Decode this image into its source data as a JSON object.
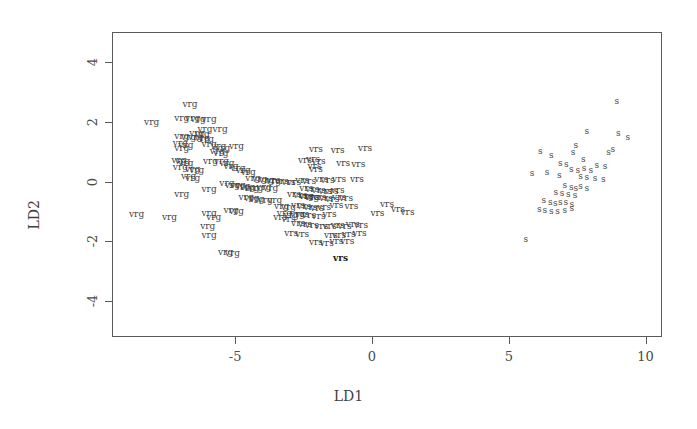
{
  "chart_data": {
    "type": "scatter",
    "title": "",
    "xlabel": "LD1",
    "ylabel": "LD2",
    "xlim": [
      -9.5,
      10.6
    ],
    "ylim": [
      -5.2,
      5.0
    ],
    "xticks": [
      -5,
      0,
      5,
      10
    ],
    "xticklabels": [
      "-5",
      "0",
      "5",
      "10"
    ],
    "yticks": [
      -4,
      -2,
      0,
      2,
      4
    ],
    "yticklabels": [
      "-4",
      "-2",
      "0",
      "2",
      "4"
    ],
    "grid": false,
    "legend": "none",
    "marker_style": "text-labels",
    "groups": [
      "vrg",
      "vrs",
      "s"
    ],
    "series": [
      {
        "name": "vrg",
        "label": "vrg",
        "points": [
          [
            -6.65,
            2.6
          ],
          [
            -6.95,
            2.12
          ],
          [
            -6.55,
            2.12
          ],
          [
            -6.35,
            2.08
          ],
          [
            -5.95,
            2.08
          ],
          [
            -8.05,
            1.98
          ],
          [
            -6.1,
            1.75
          ],
          [
            -5.55,
            1.75
          ],
          [
            -6.95,
            1.52
          ],
          [
            -6.7,
            1.5
          ],
          [
            -6.45,
            1.48
          ],
          [
            -6.2,
            1.45
          ],
          [
            -6.05,
            1.42
          ],
          [
            -7.0,
            1.3
          ],
          [
            -6.8,
            1.22
          ],
          [
            -6.95,
            1.12
          ],
          [
            -5.95,
            1.25
          ],
          [
            -5.6,
            1.2
          ],
          [
            -5.45,
            1.12
          ],
          [
            -4.95,
            1.2
          ],
          [
            -5.65,
            1.02
          ],
          [
            -5.52,
            0.95
          ],
          [
            -7.05,
            0.72
          ],
          [
            -6.92,
            0.68
          ],
          [
            -6.8,
            0.62
          ],
          [
            -5.9,
            0.7
          ],
          [
            -5.5,
            0.68
          ],
          [
            -5.3,
            0.62
          ],
          [
            -7.0,
            0.48
          ],
          [
            -6.55,
            0.42
          ],
          [
            -6.4,
            0.38
          ],
          [
            -4.9,
            0.45
          ],
          [
            -4.7,
            0.4
          ],
          [
            -4.52,
            0.32
          ],
          [
            -6.7,
            0.18
          ],
          [
            -6.55,
            0.12
          ],
          [
            -4.35,
            0.12
          ],
          [
            -4.1,
            0.08
          ],
          [
            -3.85,
            0.05
          ],
          [
            -3.6,
            0.02
          ],
          [
            -5.3,
            -0.05
          ],
          [
            -5.1,
            -0.1
          ],
          [
            -4.9,
            -0.12
          ],
          [
            -4.72,
            -0.15
          ],
          [
            -4.55,
            -0.18
          ],
          [
            -4.4,
            -0.2
          ],
          [
            -4.25,
            -0.22
          ],
          [
            -3.95,
            -0.18
          ],
          [
            -3.7,
            -0.2
          ],
          [
            -5.95,
            -0.25
          ],
          [
            -6.95,
            -0.42
          ],
          [
            -4.6,
            -0.52
          ],
          [
            -4.4,
            -0.55
          ],
          [
            -4.2,
            -0.58
          ],
          [
            -3.9,
            -0.6
          ],
          [
            -3.55,
            -0.62
          ],
          [
            -8.6,
            -1.1
          ],
          [
            -7.4,
            -1.2
          ],
          [
            -5.95,
            -1.05
          ],
          [
            -5.78,
            -1.18
          ],
          [
            -3.2,
            -1.05
          ],
          [
            -2.95,
            -1.12
          ],
          [
            -2.72,
            -1.08
          ],
          [
            -6.0,
            -1.5
          ],
          [
            -5.95,
            -1.78
          ],
          [
            -5.35,
            -2.35
          ],
          [
            -5.1,
            -2.38
          ],
          [
            -3.3,
            -0.82
          ],
          [
            -3.05,
            -0.85
          ],
          [
            -2.4,
            -0.48
          ],
          [
            -2.2,
            -0.52
          ],
          [
            -5.15,
            -0.95
          ],
          [
            -4.95,
            -0.98
          ],
          [
            -6.4,
            1.62
          ],
          [
            -6.2,
            1.58
          ],
          [
            -5.15,
            0.52
          ]
        ]
      },
      {
        "name": "vrs",
        "label": "vrs",
        "points": [
          [
            -2.05,
            1.1
          ],
          [
            -1.25,
            1.05
          ],
          [
            -0.25,
            1.12
          ],
          [
            -2.45,
            0.72
          ],
          [
            -2.1,
            0.52
          ],
          [
            -2.05,
            0.42
          ],
          [
            -1.05,
            0.62
          ],
          [
            -0.5,
            0.58
          ],
          [
            -3.6,
            0.05
          ],
          [
            -3.3,
            0.02
          ],
          [
            -3.05,
            0.0
          ],
          [
            -2.85,
            -0.02
          ],
          [
            -2.55,
            0.05
          ],
          [
            -2.3,
            0.02
          ],
          [
            -1.85,
            0.08
          ],
          [
            -1.62,
            0.05
          ],
          [
            -1.2,
            0.08
          ],
          [
            -0.55,
            0.1
          ],
          [
            -2.4,
            -0.22
          ],
          [
            -2.18,
            -0.25
          ],
          [
            -1.95,
            -0.28
          ],
          [
            -1.7,
            -0.3
          ],
          [
            -1.48,
            -0.32
          ],
          [
            -1.25,
            -0.28
          ],
          [
            -2.85,
            -0.42
          ],
          [
            -2.62,
            -0.45
          ],
          [
            -2.4,
            -0.48
          ],
          [
            -2.18,
            -0.5
          ],
          [
            -1.92,
            -0.52
          ],
          [
            -1.68,
            -0.55
          ],
          [
            -1.45,
            -0.58
          ],
          [
            -1.2,
            -0.52
          ],
          [
            -0.95,
            -0.55
          ],
          [
            -2.7,
            -0.8
          ],
          [
            -2.48,
            -0.82
          ],
          [
            -2.25,
            -0.85
          ],
          [
            -2.0,
            -0.88
          ],
          [
            -1.75,
            -0.85
          ],
          [
            -1.3,
            -0.8
          ],
          [
            -0.75,
            -0.82
          ],
          [
            0.55,
            -0.75
          ],
          [
            -2.55,
            -1.1
          ],
          [
            -2.3,
            -1.12
          ],
          [
            -1.95,
            -1.15
          ],
          [
            -1.55,
            -1.1
          ],
          [
            0.2,
            -1.05
          ],
          [
            -2.7,
            -1.4
          ],
          [
            -2.45,
            -1.42
          ],
          [
            -2.2,
            -1.45
          ],
          [
            -1.85,
            -1.48
          ],
          [
            -1.55,
            -1.5
          ],
          [
            -1.25,
            -1.45
          ],
          [
            -1.0,
            -1.48
          ],
          [
            -0.7,
            -1.42
          ],
          [
            -0.4,
            -1.45
          ],
          [
            -2.95,
            -1.72
          ],
          [
            -2.55,
            -1.75
          ],
          [
            -1.5,
            -1.78
          ],
          [
            -1.2,
            -1.8
          ],
          [
            -0.85,
            -1.75
          ],
          [
            -0.45,
            -1.72
          ],
          [
            -2.05,
            -2.02
          ],
          [
            -1.65,
            -2.05
          ],
          [
            -1.3,
            -2.0
          ],
          [
            -0.9,
            -1.98
          ],
          [
            0.95,
            -0.92
          ],
          [
            1.3,
            -1.02
          ],
          [
            -3.35,
            -1.2
          ],
          [
            -3.05,
            -1.25
          ],
          [
            -1.15,
            -2.55
          ],
          [
            -2.15,
            0.75
          ],
          [
            -1.95,
            0.68
          ]
        ],
        "bold_points": [
          [
            -1.15,
            -2.55
          ]
        ]
      },
      {
        "name": "s",
        "label": "s",
        "points": [
          [
            8.95,
            2.68
          ],
          [
            7.85,
            1.68
          ],
          [
            9.0,
            1.62
          ],
          [
            9.35,
            1.48
          ],
          [
            6.15,
            1.02
          ],
          [
            6.55,
            0.88
          ],
          [
            7.45,
            1.22
          ],
          [
            7.35,
            0.98
          ],
          [
            8.65,
            1.0
          ],
          [
            7.72,
            0.75
          ],
          [
            5.85,
            0.28
          ],
          [
            6.4,
            0.32
          ],
          [
            6.85,
            0.22
          ],
          [
            7.28,
            0.42
          ],
          [
            7.52,
            0.4
          ],
          [
            7.75,
            0.45
          ],
          [
            8.0,
            0.38
          ],
          [
            8.22,
            0.55
          ],
          [
            8.52,
            0.52
          ],
          [
            7.62,
            0.18
          ],
          [
            7.85,
            0.15
          ],
          [
            8.15,
            0.12
          ],
          [
            8.45,
            0.1
          ],
          [
            7.05,
            -0.12
          ],
          [
            7.28,
            -0.18
          ],
          [
            7.45,
            -0.22
          ],
          [
            7.62,
            -0.15
          ],
          [
            7.85,
            -0.2
          ],
          [
            6.72,
            -0.35
          ],
          [
            6.95,
            -0.38
          ],
          [
            7.18,
            -0.42
          ],
          [
            7.42,
            -0.45
          ],
          [
            6.28,
            -0.62
          ],
          [
            6.52,
            -0.68
          ],
          [
            6.7,
            -0.72
          ],
          [
            6.88,
            -0.7
          ],
          [
            7.08,
            -0.68
          ],
          [
            7.3,
            -0.75
          ],
          [
            6.12,
            -0.92
          ],
          [
            6.32,
            -0.95
          ],
          [
            6.55,
            -0.98
          ],
          [
            6.78,
            -1.0
          ],
          [
            7.05,
            -0.95
          ],
          [
            7.3,
            -0.9
          ],
          [
            5.62,
            -1.92
          ],
          [
            8.8,
            1.1
          ],
          [
            6.88,
            0.62
          ],
          [
            7.1,
            0.58
          ]
        ]
      }
    ]
  },
  "axes": {
    "x_title": "LD1",
    "y_title": "LD2",
    "x_tick_labels": [
      "-5",
      "0",
      "5",
      "10"
    ],
    "y_tick_labels": [
      "-4",
      "-2",
      "0",
      "2",
      "4"
    ]
  },
  "colors": {
    "background": "#ffffff",
    "frame": "#5a5a5a",
    "text": "#3f3f3f",
    "point_vrg": "#424242",
    "point_vrs": "#3b3b3b",
    "point_s": "#4a4a4a"
  }
}
